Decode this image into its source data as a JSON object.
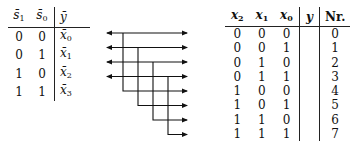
{
  "left_table": {
    "headers": [
      "s̄1",
      "s̄0",
      "ȳ"
    ],
    "header_parts": [
      {
        "base": "s̄",
        "sub": "1"
      },
      {
        "base": "s̄",
        "sub": "0"
      },
      {
        "base": "ȳ",
        "sub": ""
      }
    ],
    "rows": [
      {
        "s1": "0",
        "s0": "0",
        "y_base": "x̄",
        "y_sub": "0"
      },
      {
        "s1": "0",
        "s0": "1",
        "y_base": "x̄",
        "y_sub": "1"
      },
      {
        "s1": "1",
        "s0": "0",
        "y_base": "x̄",
        "y_sub": "2"
      },
      {
        "s1": "1",
        "s0": "1",
        "y_base": "x̄",
        "y_sub": "3"
      }
    ]
  },
  "right_table": {
    "header_parts": [
      {
        "base": "x",
        "sub": "2"
      },
      {
        "base": "x",
        "sub": "1"
      },
      {
        "base": "x",
        "sub": "0"
      },
      {
        "base": "y",
        "sub": ""
      },
      {
        "base": "Nr.",
        "sub": ""
      }
    ],
    "rows": [
      {
        "x2": "0",
        "x1": "0",
        "x0": "0",
        "y": "",
        "nr": "0"
      },
      {
        "x2": "0",
        "x1": "0",
        "x0": "1",
        "y": "",
        "nr": "1"
      },
      {
        "x2": "0",
        "x1": "1",
        "x0": "0",
        "y": "",
        "nr": "2"
      },
      {
        "x2": "0",
        "x1": "1",
        "x0": "1",
        "y": "",
        "nr": "3"
      },
      {
        "x2": "1",
        "x1": "0",
        "x0": "0",
        "y": "",
        "nr": "4"
      },
      {
        "x2": "1",
        "x1": "0",
        "x0": "1",
        "y": "",
        "nr": "5"
      },
      {
        "x2": "1",
        "x1": "1",
        "x0": "0",
        "y": "",
        "nr": "6"
      },
      {
        "x2": "1",
        "x1": "1",
        "x0": "1",
        "y": "",
        "nr": "7"
      }
    ]
  },
  "connections": [
    {
      "from_left_row": 0,
      "to_right_rows": [
        0,
        4
      ]
    },
    {
      "from_left_row": 1,
      "to_right_rows": [
        1,
        5
      ]
    },
    {
      "from_left_row": 2,
      "to_right_rows": [
        2,
        6
      ]
    },
    {
      "from_left_row": 3,
      "to_right_rows": [
        3,
        7
      ]
    }
  ],
  "colors": {
    "ink": "#111111",
    "background": "#ffffff"
  }
}
